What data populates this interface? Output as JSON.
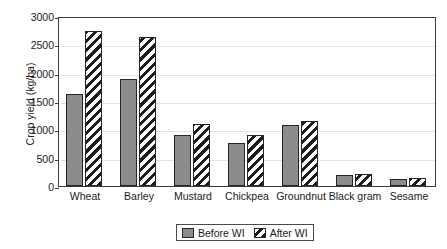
{
  "chart_data": {
    "type": "bar",
    "title": "",
    "xlabel": "",
    "ylabel": "Crop yield (kg/ha)",
    "ylim": [
      0,
      3000
    ],
    "ytick_step": 500,
    "yticks": [
      3000,
      2500,
      2000,
      1500,
      1000,
      500,
      0
    ],
    "ytick_labels": [
      "3000",
      "2500",
      "2000",
      "1500",
      "1000",
      "500",
      "0"
    ],
    "grid": true,
    "grid_axis": "y",
    "legend_position": "bottom-center",
    "categories": [
      "Wheat",
      "Barley",
      "Mustard",
      "Chickpea",
      "Groundnut",
      "Black gram",
      "Sesame"
    ],
    "series": [
      {
        "name": "Before WI",
        "color": "#8c8c8c",
        "pattern": "solid",
        "values": [
          1630,
          1880,
          905,
          760,
          1085,
          200,
          120
        ]
      },
      {
        "name": "After WI",
        "color": "#1c1c1c",
        "pattern": "diagonal-hatch",
        "values": [
          2740,
          2630,
          1100,
          900,
          1150,
          215,
          150
        ]
      }
    ]
  },
  "legend": {
    "items": [
      {
        "label": "Before WI",
        "swatch": "solid-gray"
      },
      {
        "label": "After WI",
        "swatch": "hatched"
      }
    ]
  }
}
